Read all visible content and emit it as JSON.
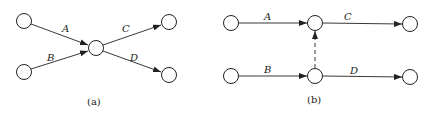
{
  "diagram_a": {
    "caption": "(a)",
    "edges": [
      {
        "label": "A",
        "from": "left-top",
        "to": "center"
      },
      {
        "label": "B",
        "from": "left-bottom",
        "to": "center"
      },
      {
        "label": "C",
        "from": "center",
        "to": "right-top"
      },
      {
        "label": "D",
        "from": "center",
        "to": "right-bottom"
      }
    ]
  },
  "diagram_b": {
    "caption": "(b)",
    "edges": [
      {
        "label": "A",
        "from": "top-left",
        "to": "top-middle"
      },
      {
        "label": "C",
        "from": "top-middle",
        "to": "top-right"
      },
      {
        "label": "B",
        "from": "bottom-left",
        "to": "bottom-middle"
      },
      {
        "label": "D",
        "from": "bottom-middle",
        "to": "bottom-right"
      },
      {
        "label": "",
        "from": "bottom-middle",
        "to": "top-middle",
        "style": "dashed"
      }
    ]
  },
  "colors": {
    "stroke": "#222222",
    "background": "#ffffff"
  }
}
